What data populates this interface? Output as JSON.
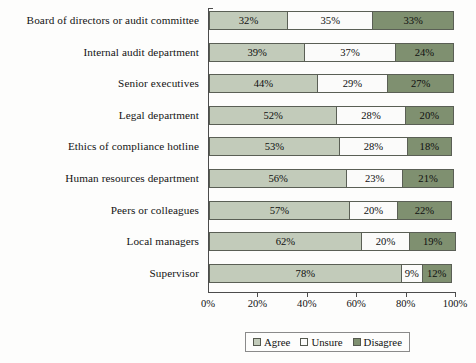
{
  "chart_data": {
    "type": "bar",
    "subtype": "horizontal-stacked-100",
    "title": "",
    "xlabel": "",
    "ylabel": "",
    "xlim": [
      0,
      100
    ],
    "grid": false,
    "legend_position": "bottom",
    "categories": [
      "Board of directors or audit committee",
      "Internal audit department",
      "Senior executives",
      "Legal department",
      "Ethics of compliance hotline",
      "Human resources department",
      "Peers or colleagues",
      "Local managers",
      "Supervisor"
    ],
    "series": [
      {
        "name": "Agree",
        "color": "#c2cbba",
        "values": [
          32,
          39,
          44,
          52,
          53,
          56,
          57,
          62,
          78
        ]
      },
      {
        "name": "Unsure",
        "color": "#fbfbfa",
        "values": [
          35,
          37,
          29,
          28,
          28,
          23,
          20,
          20,
          9
        ]
      },
      {
        "name": "Disagree",
        "color": "#7f9070",
        "values": [
          33,
          24,
          27,
          20,
          18,
          21,
          22,
          19,
          12
        ]
      }
    ],
    "value_labels": [
      [
        "32%",
        "35%",
        "33%"
      ],
      [
        "39%",
        "37%",
        "24%"
      ],
      [
        "44%",
        "29%",
        "27%"
      ],
      [
        "52%",
        "28%",
        "20%"
      ],
      [
        "53%",
        "28%",
        "18%"
      ],
      [
        "56%",
        "23%",
        "21%"
      ],
      [
        "57%",
        "20%",
        "22%"
      ],
      [
        "62%",
        "20%",
        "19%"
      ],
      [
        "78%",
        "9%",
        "12%"
      ]
    ],
    "xticks": [
      0,
      20,
      40,
      60,
      80,
      100
    ],
    "xtick_labels": [
      "0%",
      "20%",
      "40%",
      "60%",
      "80%",
      "100%"
    ]
  },
  "legend": {
    "items": [
      {
        "label": "Agree"
      },
      {
        "label": "Unsure"
      },
      {
        "label": "Disagree"
      }
    ]
  }
}
